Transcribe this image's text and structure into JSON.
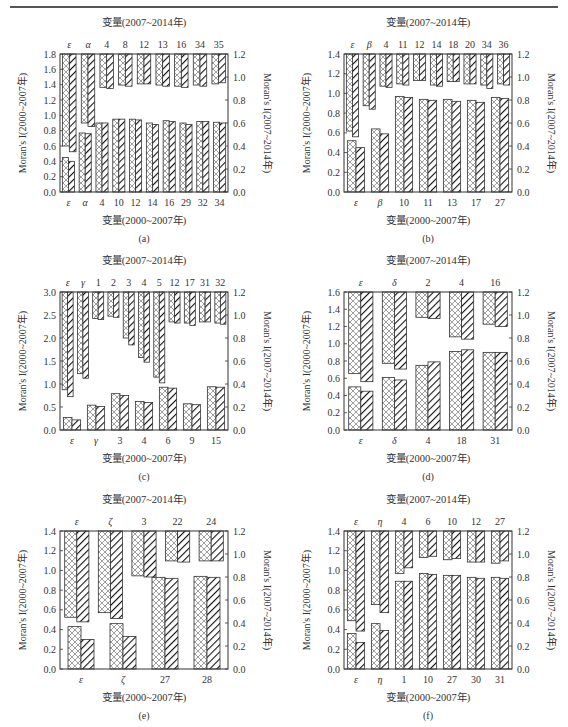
{
  "page": {
    "header_rule": true,
    "colors": {
      "axis": "#333333",
      "bar_edge": "#333333",
      "crosshatch": "#777777",
      "diagonal": "#111111",
      "background": "#ffffff"
    }
  },
  "chart_data": [
    {
      "id": "a",
      "caption": "(a)",
      "type": "bar",
      "top_title": "变量(2007~2014年)",
      "xlabel": "变量(2000~2007年)",
      "ylabel_left": "Moran's I(2000~2007年)",
      "ylabel_right": "Moran's I(2007~2014年)",
      "ylim_left": [
        0,
        1.8
      ],
      "yticks_left": [
        "0.0",
        "0.2",
        "0.4",
        "0.6",
        "0.8",
        "1.0",
        "1.2",
        "1.4",
        "1.6",
        "1.8"
      ],
      "ylim_right": [
        0,
        1.2
      ],
      "yticks_right": [
        "0.0",
        "0.2",
        "0.4",
        "0.6",
        "0.8",
        "1.0",
        "1.2"
      ],
      "bottom_categories": [
        "ε",
        "α",
        "4",
        "10",
        "12",
        "14",
        "16",
        "29",
        "32",
        "34"
      ],
      "bottom_series": [
        {
          "name": "crosshatch",
          "values": [
            0.45,
            0.77,
            0.9,
            0.95,
            0.95,
            0.9,
            0.93,
            0.9,
            0.92,
            0.91
          ]
        },
        {
          "name": "diagonal",
          "values": [
            0.4,
            0.76,
            0.9,
            0.95,
            0.94,
            0.88,
            0.92,
            0.88,
            0.92,
            0.9
          ]
        }
      ],
      "top_categories": [
        "ε",
        "α",
        "4",
        "8",
        "12",
        "13",
        "16",
        "34",
        "35"
      ],
      "top_series": [
        {
          "name": "crosshatch",
          "values": [
            0.4,
            0.6,
            0.91,
            0.93,
            0.94,
            0.93,
            0.92,
            0.93,
            0.94
          ]
        },
        {
          "name": "diagonal",
          "values": [
            0.35,
            0.57,
            0.9,
            0.92,
            0.94,
            0.92,
            0.91,
            0.92,
            0.95
          ]
        }
      ]
    },
    {
      "id": "b",
      "caption": "(b)",
      "type": "bar",
      "top_title": "变量(2007~2014年)",
      "xlabel": "变量(2000~2007年)",
      "ylabel_left": "Moran's I(2000~2007年)",
      "ylabel_right": "Moran's I(2007~2014年)",
      "ylim_left": [
        0,
        1.4
      ],
      "yticks_left": [
        "0.0",
        "0.2",
        "0.4",
        "0.6",
        "0.8",
        "1.0",
        "1.2",
        "1.4"
      ],
      "ylim_right": [
        0,
        1.2
      ],
      "yticks_right": [
        "0.0",
        "0.2",
        "0.4",
        "0.6",
        "0.8",
        "1.0",
        "1.2"
      ],
      "bottom_categories": [
        "ε",
        "β",
        "10",
        "11",
        "13",
        "17",
        "27"
      ],
      "bottom_series": [
        {
          "name": "crosshatch",
          "values": [
            0.52,
            0.64,
            0.97,
            0.94,
            0.94,
            0.93,
            0.96
          ]
        },
        {
          "name": "diagonal",
          "values": [
            0.45,
            0.59,
            0.96,
            0.93,
            0.92,
            0.91,
            0.95
          ]
        }
      ],
      "top_categories": [
        "ε",
        "β",
        "4",
        "11",
        "12",
        "14",
        "18",
        "20",
        "34",
        "36"
      ],
      "top_series": [
        {
          "name": "crosshatch",
          "values": [
            0.53,
            0.75,
            0.92,
            0.94,
            0.97,
            0.93,
            0.96,
            0.94,
            0.93,
            0.94
          ]
        },
        {
          "name": "diagonal",
          "values": [
            0.48,
            0.72,
            0.91,
            0.93,
            0.97,
            0.92,
            0.96,
            0.94,
            0.9,
            0.93
          ]
        }
      ]
    },
    {
      "id": "c",
      "caption": "(c)",
      "type": "bar",
      "top_title": "变量(2007~2014年)",
      "xlabel": "变量(2000~2007年)",
      "ylabel_left": "Moran's I(2000~2007年)",
      "ylabel_right": "Moran's I(2007~2014年)",
      "ylim_left": [
        0,
        3.0
      ],
      "yticks_left": [
        "0.0",
        "0.5",
        "1.0",
        "1.5",
        "2.0",
        "2.5",
        "3.0"
      ],
      "ylim_right": [
        0,
        1.2
      ],
      "yticks_right": [
        "0.0",
        "0.2",
        "0.4",
        "0.6",
        "0.8",
        "1.0",
        "1.2"
      ],
      "bottom_categories": [
        "ε",
        "γ",
        "3",
        "4",
        "6",
        "9",
        "15"
      ],
      "bottom_series": [
        {
          "name": "crosshatch",
          "values": [
            0.27,
            0.54,
            0.79,
            0.62,
            0.93,
            0.57,
            0.94
          ]
        },
        {
          "name": "diagonal",
          "values": [
            0.22,
            0.51,
            0.75,
            0.6,
            0.91,
            0.55,
            0.93
          ]
        }
      ],
      "top_categories": [
        "ε",
        "γ",
        "1",
        "2",
        "3",
        "4",
        "5",
        "12",
        "17",
        "31",
        "32"
      ],
      "top_series": [
        {
          "name": "crosshatch",
          "values": [
            0.35,
            0.49,
            0.97,
            0.99,
            0.8,
            0.63,
            0.46,
            0.94,
            0.93,
            0.94,
            0.93
          ]
        },
        {
          "name": "diagonal",
          "values": [
            0.29,
            0.45,
            0.96,
            0.98,
            0.74,
            0.59,
            0.41,
            0.93,
            0.91,
            0.94,
            0.92
          ]
        }
      ]
    },
    {
      "id": "d",
      "caption": "(d)",
      "type": "bar",
      "top_title": "变量(2007~2014年)",
      "xlabel": "变量(2000~2007年)",
      "ylabel_left": "Moran's I(2000~2007年)",
      "ylabel_right": "Moran's I(2007~2014年)",
      "ylim_left": [
        0,
        1.6
      ],
      "yticks_left": [
        "0.0",
        "0.2",
        "0.4",
        "0.6",
        "0.8",
        "1.0",
        "1.2",
        "1.4",
        "1.6"
      ],
      "ylim_right": [
        0,
        1.2
      ],
      "yticks_right": [
        "0.0",
        "0.2",
        "0.4",
        "0.6",
        "0.8",
        "1.0",
        "1.2"
      ],
      "bottom_categories": [
        "ε",
        "δ",
        "4",
        "18",
        "31"
      ],
      "bottom_series": [
        {
          "name": "crosshatch",
          "values": [
            0.5,
            0.61,
            0.75,
            0.91,
            0.9
          ]
        },
        {
          "name": "diagonal",
          "values": [
            0.45,
            0.58,
            0.79,
            0.93,
            0.9
          ]
        }
      ],
      "top_categories": [
        "ε",
        "δ",
        "2",
        "4",
        "16"
      ],
      "top_series": [
        {
          "name": "crosshatch",
          "values": [
            0.49,
            0.58,
            0.98,
            0.81,
            0.92
          ]
        },
        {
          "name": "diagonal",
          "values": [
            0.42,
            0.53,
            0.97,
            0.79,
            0.9
          ]
        }
      ]
    },
    {
      "id": "e",
      "caption": "(e)",
      "type": "bar",
      "top_title": "变量(2007~2014年)",
      "xlabel": "变量(2000~2007年)",
      "ylabel_left": "Moran's I(2000~2007年)",
      "ylabel_right": "Moran's I(2007~2014年)",
      "ylim_left": [
        0,
        1.4
      ],
      "yticks_left": [
        "0.0",
        "0.2",
        "0.4",
        "0.6",
        "0.8",
        "1.0",
        "1.2",
        "1.4"
      ],
      "ylim_right": [
        0,
        1.2
      ],
      "yticks_right": [
        "0.0",
        "0.2",
        "0.4",
        "0.6",
        "0.8",
        "1.0",
        "1.2"
      ],
      "bottom_categories": [
        "ε",
        "ζ",
        "27",
        "28"
      ],
      "bottom_series": [
        {
          "name": "crosshatch",
          "values": [
            0.43,
            0.46,
            0.93,
            0.94
          ]
        },
        {
          "name": "diagonal",
          "values": [
            0.3,
            0.33,
            0.92,
            0.93
          ]
        }
      ],
      "top_categories": [
        "ε",
        "ζ",
        "3",
        "22",
        "24"
      ],
      "top_series": [
        {
          "name": "crosshatch",
          "values": [
            0.45,
            0.49,
            0.81,
            0.94,
            0.94
          ]
        },
        {
          "name": "diagonal",
          "values": [
            0.41,
            0.44,
            0.8,
            0.93,
            0.94
          ]
        }
      ]
    },
    {
      "id": "f",
      "caption": "(f)",
      "type": "bar",
      "top_title": "变量(2007~2014年)",
      "xlabel": "变量(2000~2007年)",
      "ylabel_left": "Moran's I(2000~2007年)",
      "ylabel_right": "Moran's I(2007~2014年)",
      "ylim_left": [
        0,
        1.4
      ],
      "yticks_left": [
        "0.0",
        "0.2",
        "0.4",
        "0.6",
        "0.8",
        "1.0",
        "1.2",
        "1.4"
      ],
      "ylim_right": [
        0,
        1.2
      ],
      "yticks_right": [
        "0.0",
        "0.2",
        "0.4",
        "0.6",
        "0.8",
        "1.0",
        "1.2"
      ],
      "bottom_categories": [
        "ε",
        "η",
        "1",
        "10",
        "27",
        "30",
        "31"
      ],
      "bottom_series": [
        {
          "name": "crosshatch",
          "values": [
            0.36,
            0.46,
            0.89,
            0.97,
            0.95,
            0.93,
            0.93
          ]
        },
        {
          "name": "diagonal",
          "values": [
            0.27,
            0.39,
            0.89,
            0.96,
            0.95,
            0.92,
            0.92
          ]
        }
      ],
      "top_categories": [
        "ε",
        "η",
        "4",
        "6",
        "10",
        "12",
        "27"
      ],
      "top_series": [
        {
          "name": "crosshatch",
          "values": [
            0.42,
            0.56,
            0.83,
            0.97,
            0.95,
            0.93,
            0.92
          ]
        },
        {
          "name": "diagonal",
          "values": [
            0.33,
            0.49,
            0.88,
            0.98,
            0.96,
            0.93,
            0.94
          ]
        }
      ]
    }
  ]
}
